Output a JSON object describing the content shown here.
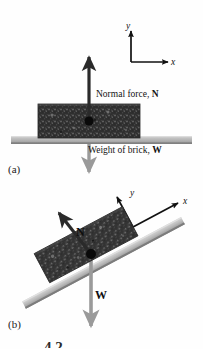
{
  "figure": {
    "panels": [
      {
        "id": "a",
        "label": "(a)",
        "annotations": {
          "normal_force": "Normal force, ",
          "normal_force_symbol": "N",
          "weight": "Weight of brick, ",
          "weight_symbol": "W"
        },
        "axes": {
          "y": "y",
          "x": "x"
        }
      },
      {
        "id": "b",
        "label": "(b)",
        "annotations": {
          "normal_force_symbol": "N",
          "weight_symbol": "W"
        },
        "axes": {
          "y": "y",
          "x": "x"
        }
      }
    ],
    "caption_partial": "4.2",
    "colors": {
      "background": "#fefefe",
      "brick_dark": "#2e2e2e",
      "brick_speckle": "#6d6d6d",
      "surface_gray": "#b9b9b9",
      "surface_gray_light": "#d2d2d2",
      "surface_gray_dark": "#8f8f8f",
      "arrow_normal": "#2a2a2a",
      "arrow_weight": "#9a9a9a",
      "axis_black": "#111111",
      "pivot_dot": "#0a0a0a",
      "text": "#141414"
    }
  }
}
